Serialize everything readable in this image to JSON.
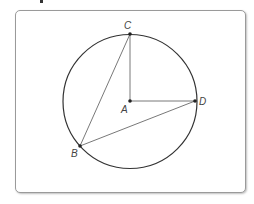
{
  "diagram": {
    "type": "circle-geometry",
    "circle": {
      "center": "A",
      "cx": 130,
      "cy": 101.5,
      "r": 67
    },
    "points": [
      {
        "id": "A",
        "label": "A",
        "x": 130,
        "y": 101,
        "label_x": 121,
        "label_y": 113
      },
      {
        "id": "C",
        "label": "C",
        "x": 130,
        "y": 34,
        "label_x": 124,
        "label_y": 29
      },
      {
        "id": "D",
        "label": "D",
        "x": 195,
        "y": 101,
        "label_x": 199,
        "label_y": 105
      },
      {
        "id": "B",
        "label": "B",
        "x": 80,
        "y": 146,
        "label_x": 71,
        "label_y": 157
      }
    ],
    "segments": [
      {
        "from": "A",
        "to": "C",
        "name": "radius-AC"
      },
      {
        "from": "A",
        "to": "D",
        "name": "radius-AD"
      },
      {
        "from": "B",
        "to": "C",
        "name": "chord-BC"
      },
      {
        "from": "B",
        "to": "D",
        "name": "chord-BD"
      }
    ],
    "colors": {
      "stroke": "#333333",
      "thin_stroke": "#555555",
      "frame": "#9a9a9a"
    }
  }
}
